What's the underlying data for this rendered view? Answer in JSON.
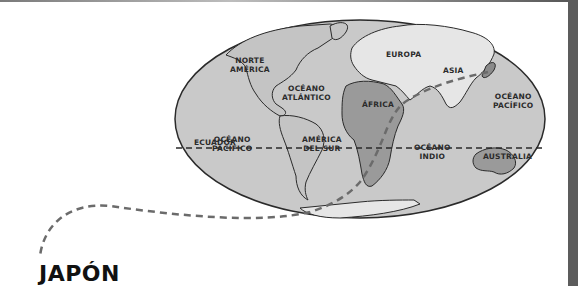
{
  "title": "JAPÓN",
  "map": {
    "labels": {
      "north_america": "NORTE\nAMÉRICA",
      "atlantic": "OCÉANO\nATLÁNTICO",
      "europe": "EUROPA",
      "asia": "ASIA",
      "africa": "ÁFRICA",
      "pacific_east": "OCÉANO\nPACÍFICO",
      "equator": "ECUADOR",
      "pacific_west": "OCÉANO\nPACÍFICO",
      "south_america": "AMÉRICA\nDEL SUR",
      "indian": "OCÉANO\nINDIO",
      "australia": "AUSTRALIA"
    },
    "colors": {
      "ocean": "#c9c9c9",
      "land_light": "#e6e6e6",
      "land_dark": "#9a9a9a",
      "outline": "#2a2a2a",
      "route": "#6b6b6b"
    }
  }
}
